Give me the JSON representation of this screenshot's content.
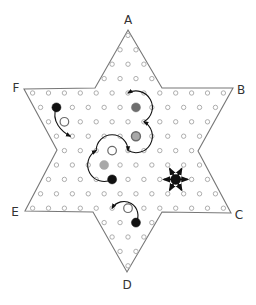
{
  "diagram": {
    "grid": {
      "center_x": 128,
      "row0_y": 35.4,
      "row_step": 14.4,
      "col_step": 15.9
    },
    "row_hole_counts": [
      1,
      2,
      3,
      4,
      13,
      12,
      11,
      10,
      9,
      10,
      11,
      12,
      13,
      4,
      3,
      2,
      1
    ],
    "star_outline": [
      [
        128,
        30
      ],
      [
        162,
        88
      ],
      [
        233,
        88
      ],
      [
        198,
        151
      ],
      [
        231,
        213
      ],
      [
        162,
        212
      ],
      [
        127,
        272
      ],
      [
        93,
        212
      ],
      [
        25,
        211
      ],
      [
        57,
        150
      ],
      [
        24,
        89
      ],
      [
        95,
        88
      ]
    ],
    "corner_labels": [
      {
        "id": "A",
        "text": "A",
        "x": 128,
        "y": 24
      },
      {
        "id": "B",
        "text": "B",
        "x": 241,
        "y": 94
      },
      {
        "id": "C",
        "text": "C",
        "x": 239,
        "y": 219
      },
      {
        "id": "D",
        "text": "D",
        "x": 127,
        "y": 289
      },
      {
        "id": "E",
        "text": "E",
        "x": 15,
        "y": 216
      },
      {
        "id": "F",
        "text": "F",
        "x": 16,
        "y": 92
      }
    ],
    "colors": {
      "black": "#111111",
      "dark_gray": "#6e6e6e",
      "gray": "#a8a8a8",
      "hole_stroke": "#9a9a9a",
      "outline": "#777777"
    },
    "pieces": [
      {
        "name": "black-piece-left",
        "row": 5,
        "col": -4.5,
        "fill": "black",
        "r": 4.5
      },
      {
        "name": "dark-gray-piece",
        "row": 5,
        "col": 0.5,
        "fill": "dark_gray",
        "r": 4.5
      },
      {
        "name": "gray-piece-mid",
        "row": 7,
        "col": 0.5,
        "fill": "gray",
        "r": 4.5,
        "ring": true
      },
      {
        "name": "gray-piece-lower",
        "row": 9,
        "col": -1.5,
        "fill": "gray",
        "r": 4.5
      },
      {
        "name": "black-piece-center",
        "row": 10,
        "col": -1,
        "fill": "black",
        "r": 4.5
      },
      {
        "name": "black-piece-star",
        "row": 10,
        "col": 3,
        "fill": "black",
        "r": 5
      },
      {
        "name": "black-piece-bottom",
        "row": 13,
        "col": 0.5,
        "fill": "black",
        "r": 4.5
      }
    ],
    "open_rings": [
      {
        "name": "jumped-ring-left",
        "row": 6,
        "col": -4
      },
      {
        "name": "jumped-ring-center",
        "row": 8,
        "col": -1
      },
      {
        "name": "jumped-ring-bottom",
        "row": 12,
        "col": 0
      }
    ],
    "moves": [
      {
        "name": "step-move-left",
        "from": [
          5,
          -4.5
        ],
        "to": [
          7,
          -3.5
        ],
        "type": "step"
      },
      {
        "name": "hop-chain",
        "points": [
          [
            10,
            -1
          ],
          [
            8,
            -2
          ],
          [
            8,
            0
          ],
          [
            6,
            1
          ],
          [
            4,
            0
          ]
        ],
        "type": "hop-chain"
      },
      {
        "name": "hop-move-bottom",
        "from": [
          13,
          0.5
        ],
        "to": [
          12,
          -1
        ],
        "type": "hop"
      }
    ],
    "star_piece_directions": {
      "center": [
        10,
        3
      ],
      "neighbors": [
        [
          10,
          2
        ],
        [
          10,
          4
        ],
        [
          9,
          2.5
        ],
        [
          9,
          3.5
        ],
        [
          11,
          2.5
        ],
        [
          11,
          3.5
        ]
      ]
    }
  }
}
